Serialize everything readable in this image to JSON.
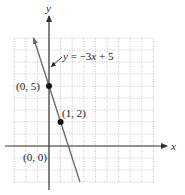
{
  "chart_data": {
    "type": "line",
    "title": "",
    "xlabel": "x",
    "ylabel": "y",
    "xlim": [
      -3,
      9
    ],
    "ylim": [
      -3,
      9
    ],
    "grid": true,
    "grid_style": "dotted",
    "series": [
      {
        "name": "y = −3x + 5",
        "equation": "y = -3x + 5",
        "slope": -3,
        "intercept": 5,
        "x": [
          -1.33,
          2.67
        ],
        "y": [
          9,
          -3
        ]
      }
    ],
    "points": [
      {
        "x": 0,
        "y": 5,
        "label": "(0, 5)"
      },
      {
        "x": 1,
        "y": 2,
        "label": "(1, 2)"
      }
    ],
    "annotations": [
      {
        "text": "y = −3x + 5",
        "points_to": {
          "x": 0,
          "y": 6
        }
      },
      {
        "text": "(0, 0)",
        "at": {
          "x": 0,
          "y": 0
        }
      }
    ]
  },
  "labels": {
    "x_axis": "x",
    "y_axis": "y",
    "equation_y": "y",
    "equation_eq": " = −3",
    "equation_x": "x",
    "equation_rest": " + 5",
    "point_a": "(0, 5)",
    "point_b": "(1, 2)",
    "origin": "(0, 0)"
  },
  "colors": {
    "axis": "#333333",
    "grid": "#b8b8b8",
    "line": "#666666",
    "point": "#111111"
  }
}
